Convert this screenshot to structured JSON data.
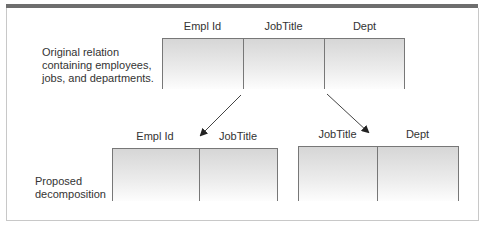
{
  "original": {
    "label_lines": [
      "Original relation",
      "containing employees,",
      "jobs, and departments."
    ],
    "columns": [
      "Empl Id",
      "JobTitle",
      "Dept"
    ]
  },
  "decomposition": {
    "label_lines": [
      "Proposed",
      "decomposition"
    ],
    "left_table": {
      "columns": [
        "Empl Id",
        "JobTitle"
      ]
    },
    "right_table": {
      "columns": [
        "JobTitle",
        "Dept"
      ]
    }
  },
  "colors": {
    "border": "#777777",
    "topbar": "#6e6e6e"
  }
}
